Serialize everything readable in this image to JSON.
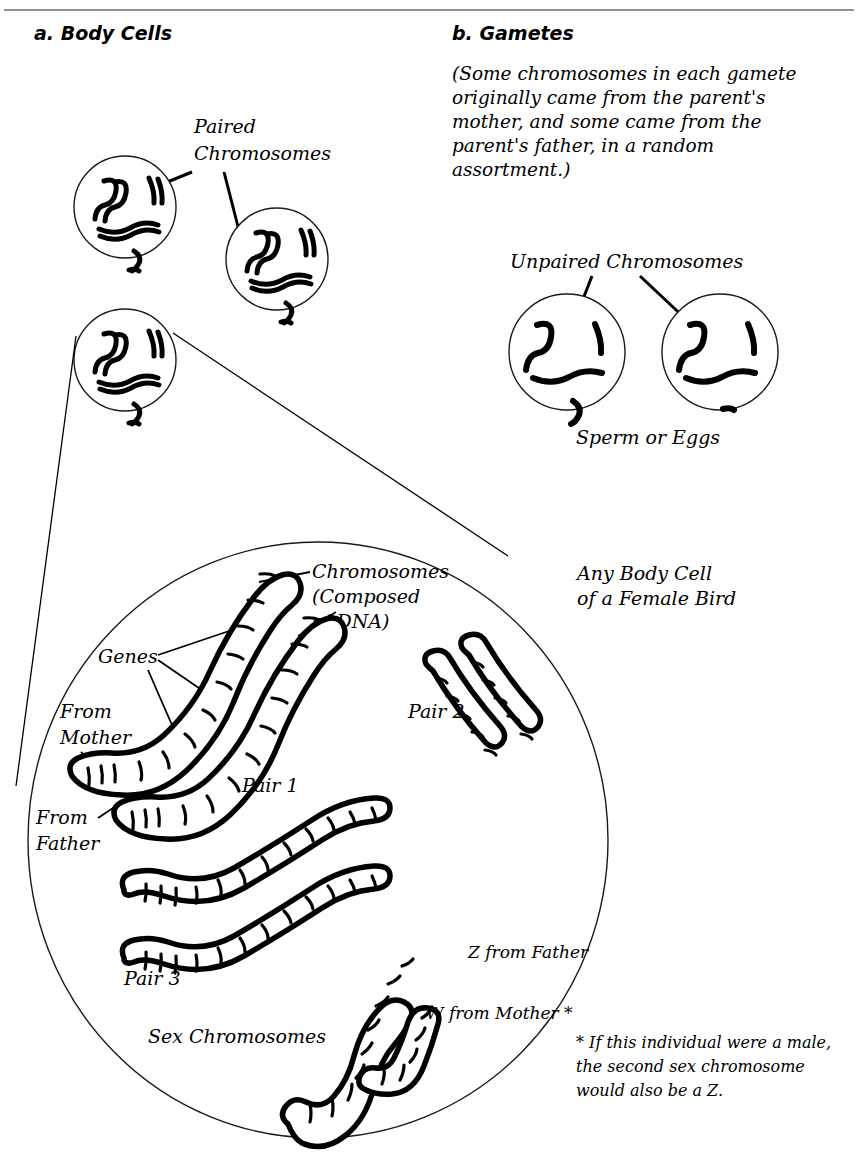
{
  "figure": {
    "title_a": "a. Body Cells",
    "title_b": "b. Gametes",
    "gametes_paragraph": "(Some chromosomes in each gamete originally came from the parent's mother, and some came from the parent's father, in a random assortment.)",
    "labels": {
      "paired_chromosomes_line1": "Paired",
      "paired_chromosomes_line2": "Chromosomes",
      "unpaired_chromosomes": "Unpaired Chromosomes",
      "sperm_or_eggs": "Sperm or Eggs",
      "any_body_cell_line1": "Any Body Cell",
      "any_body_cell_line2": "of a Female Bird",
      "chromosomes_line1": "Chromosomes",
      "chromosomes_line2": "(Composed",
      "chromosomes_line3": "of DNA)",
      "genes": "Genes",
      "from_mother_line1": "From",
      "from_mother_line2": "Mother",
      "from_father_line1": "From",
      "from_father_line2": "Father",
      "pair_1": "Pair 1",
      "pair_2": "Pair 2",
      "pair_3": "Pair 3",
      "sex_chromosomes": "Sex Chromosomes",
      "z_from_father": "Z from Father",
      "w_from_mother": "W from Mother *",
      "footnote_line1": "* If this individual were a male,",
      "footnote_line2": "the second sex chromosome",
      "footnote_line3": "would also be a Z."
    },
    "colors": {
      "ink": "#000000",
      "background": "#ffffff",
      "rule": "#6e6e6e",
      "cell_outline": "#1a1a1a"
    },
    "counts": {
      "body_cells_shown": 3,
      "gamete_cells_shown": 2,
      "chromosome_pairs_in_body_cell": 3,
      "sex_chromosomes_in_body_cell": 2
    }
  }
}
